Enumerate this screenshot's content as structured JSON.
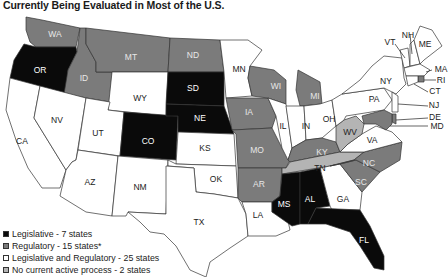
{
  "title": "Currently Being Evaluated in Most of the U.S.",
  "colors": {
    "legislative": "#0a0a0a",
    "regulatory": "#7b7b7b",
    "legislative_regulatory": "#ffffff",
    "no_process": "#b4b4b4",
    "border": "#333333"
  },
  "legend": [
    {
      "category": "legislative",
      "label": "Legislative - 7 states"
    },
    {
      "category": "regulatory",
      "label": "Regulatory - 15 states*"
    },
    {
      "category": "legislative_regulatory",
      "label": "Legislative and Regulatory - 25 states"
    },
    {
      "category": "no_process",
      "label": "No current active process - 2 states"
    }
  ],
  "states": {
    "WA": {
      "label": "WA",
      "category": "regulatory"
    },
    "OR": {
      "label": "OR",
      "category": "legislative"
    },
    "CA": {
      "label": "CA",
      "category": "legislative_regulatory"
    },
    "ID": {
      "label": "ID",
      "category": "regulatory"
    },
    "NV": {
      "label": "NV",
      "category": "legislative_regulatory"
    },
    "MT": {
      "label": "MT",
      "category": "regulatory"
    },
    "WY": {
      "label": "WY",
      "category": "legislative_regulatory"
    },
    "UT": {
      "label": "UT",
      "category": "legislative_regulatory"
    },
    "AZ": {
      "label": "AZ",
      "category": "legislative_regulatory"
    },
    "CO": {
      "label": "CO",
      "category": "legislative"
    },
    "NM": {
      "label": "NM",
      "category": "legislative_regulatory"
    },
    "ND": {
      "label": "ND",
      "category": "regulatory"
    },
    "SD": {
      "label": "SD",
      "category": "legislative"
    },
    "NE": {
      "label": "NE",
      "category": "legislative"
    },
    "KS": {
      "label": "KS",
      "category": "legislative_regulatory"
    },
    "OK": {
      "label": "OK",
      "category": "legislative_regulatory"
    },
    "TX": {
      "label": "TX",
      "category": "legislative_regulatory"
    },
    "MN": {
      "label": "MN",
      "category": "legislative_regulatory"
    },
    "IA": {
      "label": "IA",
      "category": "regulatory"
    },
    "MO": {
      "label": "MO",
      "category": "regulatory"
    },
    "AR": {
      "label": "AR",
      "category": "regulatory"
    },
    "LA": {
      "label": "LA",
      "category": "legislative_regulatory"
    },
    "WI": {
      "label": "WI",
      "category": "regulatory"
    },
    "IL": {
      "label": "IL",
      "category": "legislative_regulatory"
    },
    "MI": {
      "label": "MI",
      "category": "regulatory"
    },
    "IN": {
      "label": "IN",
      "category": "legislative_regulatory"
    },
    "OH": {
      "label": "OH",
      "category": "legislative_regulatory"
    },
    "KY": {
      "label": "KY",
      "category": "regulatory"
    },
    "TN": {
      "label": "TN",
      "category": "no_process"
    },
    "MS": {
      "label": "MS",
      "category": "legislative"
    },
    "AL": {
      "label": "AL",
      "category": "legislative"
    },
    "GA": {
      "label": "GA",
      "category": "legislative_regulatory"
    },
    "FL": {
      "label": "FL",
      "category": "legislative"
    },
    "SC": {
      "label": "SC",
      "category": "regulatory"
    },
    "NC": {
      "label": "NC",
      "category": "regulatory"
    },
    "VA": {
      "label": "VA",
      "category": "legislative_regulatory"
    },
    "WV": {
      "label": "WV",
      "category": "no_process"
    },
    "PA": {
      "label": "PA",
      "category": "legislative_regulatory"
    },
    "NY": {
      "label": "NY",
      "category": "legislative_regulatory"
    },
    "VT": {
      "label": "VT",
      "category": "legislative_regulatory"
    },
    "NH": {
      "label": "NH",
      "category": "legislative_regulatory"
    },
    "ME": {
      "label": "ME",
      "category": "legislative_regulatory"
    },
    "MA": {
      "label": "MA",
      "category": "legislative_regulatory"
    },
    "RI": {
      "label": "RI",
      "category": "regulatory"
    },
    "CT": {
      "label": "CT",
      "category": "legislative_regulatory"
    },
    "NJ": {
      "label": "NJ",
      "category": "legislative_regulatory"
    },
    "DE": {
      "label": "DE",
      "category": "regulatory"
    },
    "MD": {
      "label": "MD",
      "category": "regulatory"
    }
  }
}
